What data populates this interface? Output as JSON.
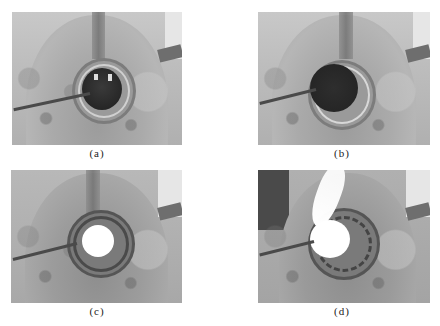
{
  "figure": {
    "panels": [
      {
        "id": "a",
        "label": "(a)",
        "description": "Dark open ring with metal rod inserted from left; interior shows bright specks"
      },
      {
        "id": "b",
        "label": "(b)",
        "description": "Dark open ring with metal rod inserted from left; interior fully dark"
      },
      {
        "id": "c",
        "label": "(c)",
        "description": "Ring with bright white glowing center; rod inserted from left"
      },
      {
        "id": "d",
        "label": "(d)",
        "description": "Bright white flame/plume rising from ring center; rod inserted from left"
      }
    ]
  },
  "colors": {
    "background": "#ffffff",
    "photo_tone": "#b4b4b4",
    "hole_dark": "#2e2e2e",
    "glow": "#ffffff"
  }
}
